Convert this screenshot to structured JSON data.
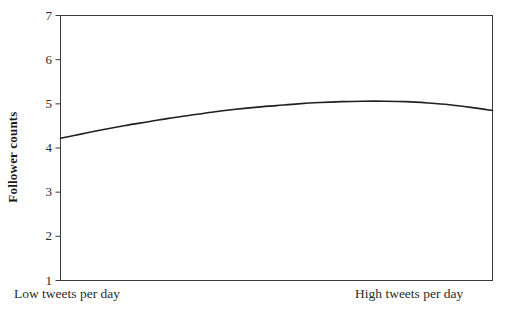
{
  "chart_data": {
    "type": "line",
    "title": "",
    "subtitle": "",
    "xlabel": "",
    "ylabel": "Follower counts",
    "ylim": [
      1,
      7
    ],
    "yticks": [
      1,
      2,
      3,
      4,
      5,
      6,
      7
    ],
    "ytick_labels": [
      "1",
      "2",
      "3",
      "4",
      "5",
      "6",
      "7"
    ],
    "xlim": [
      0,
      1
    ],
    "xtick_labels": [
      "Low tweets per day",
      "High tweets per day"
    ],
    "grid": false,
    "legend": null,
    "legend_position": "none",
    "series": [
      {
        "name": "Follower counts",
        "color": "#1f1f1f",
        "line_width": 1.6,
        "x": [
          0.0,
          0.05,
          0.1,
          0.15,
          0.2,
          0.25,
          0.3,
          0.35,
          0.4,
          0.45,
          0.5,
          0.55,
          0.6,
          0.65,
          0.7,
          0.75,
          0.8,
          0.85,
          0.9,
          0.95,
          1.0
        ],
        "values": [
          4.22,
          4.32,
          4.42,
          4.51,
          4.59,
          4.67,
          4.74,
          4.81,
          4.87,
          4.92,
          4.96,
          5.0,
          5.03,
          5.05,
          5.06,
          5.06,
          5.05,
          5.02,
          4.98,
          4.92,
          4.85
        ]
      }
    ],
    "annotations": [],
    "axis_color": "#3a3a3a",
    "background": "#ffffff"
  },
  "axis_labels": {
    "y_title": "Follower counts",
    "x_low": "Low tweets per day",
    "x_high": "High tweets per day"
  }
}
